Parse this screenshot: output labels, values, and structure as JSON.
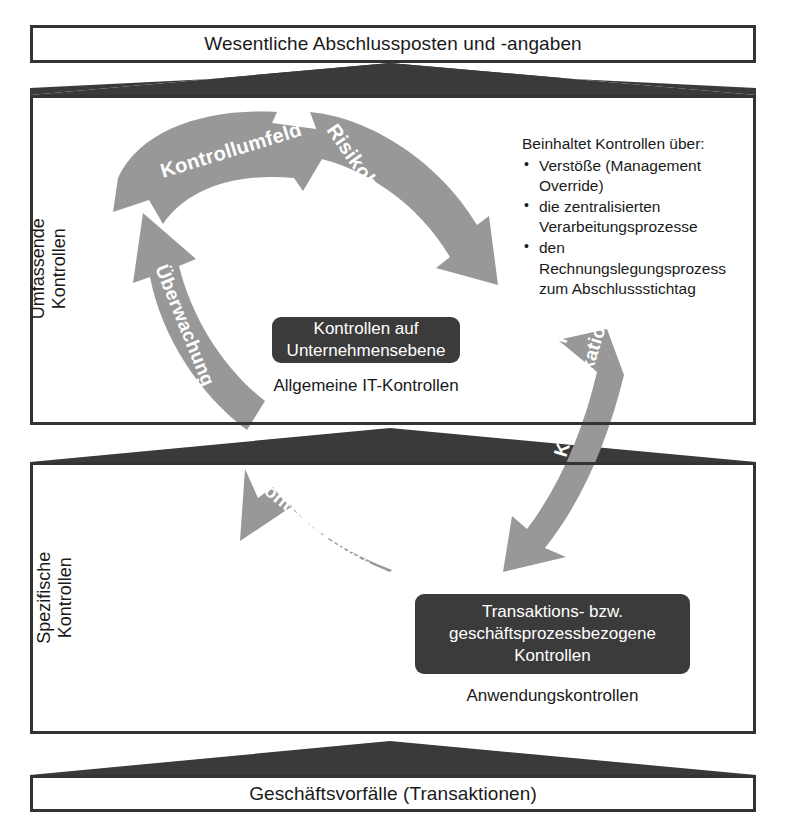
{
  "diagram": {
    "colors": {
      "arrow_gray": "#989898",
      "dark_box": "#3b3b3b",
      "connector_dark": "#3a3a3a",
      "outline": "#333333",
      "text": "#1a1a1a",
      "arrow_label_text": "#ffffff"
    }
  },
  "bands": {
    "top": {
      "label": "Wesentliche Abschlussposten und -angaben"
    },
    "upper_section": {
      "side_label_line1": "Umfassende",
      "side_label_line2": "Kontrollen"
    },
    "lower_section": {
      "side_label_line1": "Spezifische",
      "side_label_line2": "Kontrollen"
    },
    "bottom": {
      "label": "Geschäftsvorfälle (Transaktionen)"
    }
  },
  "upper_section": {
    "arrows": [
      {
        "id": "kontrollumfeld",
        "label": "Kontrollumfeld"
      },
      {
        "id": "risikobeurteilungen",
        "label": "Risikobeurteilungen"
      },
      {
        "id": "ueberwachung",
        "label": "Überwachung"
      }
    ],
    "dark_box": {
      "line1": "Kontrollen auf",
      "line2": "Unternehmensebene"
    },
    "caption": "Allgemeine IT-Kontrollen",
    "bullets": {
      "heading": "Beinhaltet Kontrollen über:",
      "items": [
        "Verstöße (Management Override)",
        "die zentralisierten Verarbeitungsprozesse",
        "den Rechnungslegungsprozess zum Abschlussstichtag"
      ]
    }
  },
  "lower_section": {
    "arrows": [
      {
        "id": "kontrollaktivitaeten",
        "label": "Kontrollaktivitäten"
      }
    ],
    "dark_box": {
      "line1": "Transaktions- bzw.",
      "line2": "geschäftsprozessbezogene",
      "line3": "Kontrollen"
    },
    "caption": "Anwendungskontrollen"
  },
  "cross_section_arrow": {
    "id": "information-und-kommunikation",
    "line1": "Information und",
    "line2": "Kommunikation"
  }
}
